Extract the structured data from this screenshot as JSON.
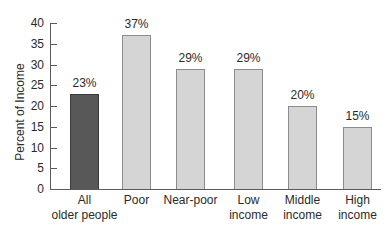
{
  "chart_data": {
    "type": "bar",
    "title": "",
    "xlabel": "",
    "ylabel": "Percent of Income",
    "ylim": [
      0,
      40
    ],
    "yticks": [
      0,
      5,
      10,
      15,
      20,
      25,
      30,
      35,
      40
    ],
    "grid": false,
    "legend": null,
    "categories": [
      "All\nolder people",
      "Poor",
      "Near-poor",
      "Low\nincome",
      "Middle\nincome",
      "High\nincome"
    ],
    "values": [
      23,
      37,
      29,
      29,
      20,
      15
    ],
    "value_labels": [
      "23%",
      "37%",
      "29%",
      "29%",
      "20%",
      "15%"
    ],
    "bar_styles": [
      "dark",
      "light",
      "light",
      "light",
      "light",
      "light"
    ]
  },
  "colors": {
    "highlight_bar": "#585858",
    "bar": "#d5d5d5",
    "bar_border": "#8c8c8c",
    "axis": "#5a5a5a"
  }
}
